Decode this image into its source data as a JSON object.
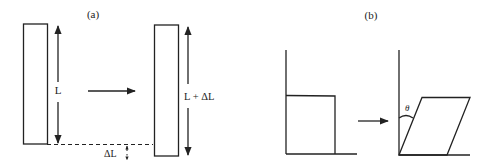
{
  "panels": {
    "a": {
      "label": "(a)",
      "original_length_label": "L",
      "stretched_length_label": "L + ΔL",
      "extension_label": "ΔL",
      "description": "Tensile strain: bar of length L stretched to L + ΔL"
    },
    "b": {
      "label": "(b)",
      "angle_label": "θ",
      "description": "Shear strain: square deformed into parallelogram with shear angle θ"
    }
  },
  "colors": {
    "line": "#222222",
    "background": "#ffffff"
  }
}
